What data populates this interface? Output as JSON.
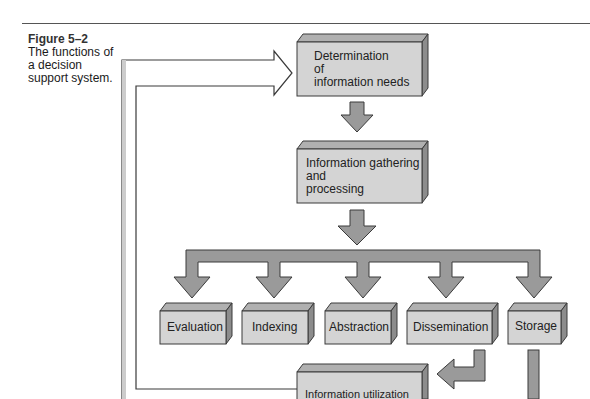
{
  "figure": {
    "number": "Figure 5–2",
    "caption": "The functions of a decision support system.",
    "caption_lines": [
      "The functions of",
      "a decision",
      "support system."
    ]
  },
  "colors": {
    "box_face": "#d4d4d4",
    "box_top": "#b0b0b0",
    "box_side": "#8c8c8c",
    "arrow_fill": "#9a9a9a",
    "outline": "#3a3a3a"
  },
  "nodes": {
    "determination": {
      "lines": [
        "Determination",
        "of",
        "information needs"
      ]
    },
    "gathering": {
      "lines": [
        "Information gathering",
        "and",
        "processing"
      ]
    },
    "functions": [
      {
        "label": "Evaluation"
      },
      {
        "label": "Indexing"
      },
      {
        "label": "Abstraction"
      },
      {
        "label": "Dissemination"
      },
      {
        "label": "Storage"
      }
    ],
    "utilization": {
      "lines": [
        "Information utilization"
      ]
    }
  }
}
